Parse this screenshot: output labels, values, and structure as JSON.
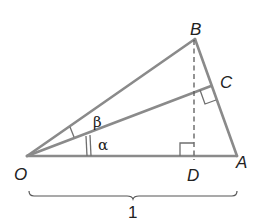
{
  "diagram": {
    "points": {
      "O": {
        "label": "O",
        "x": 27,
        "y": 156
      },
      "A": {
        "label": "A",
        "x": 237,
        "y": 156
      },
      "B": {
        "label": "B",
        "x": 195,
        "y": 39
      },
      "C": {
        "label": "C",
        "x": 211,
        "y": 86
      },
      "D": {
        "label": "D",
        "x": 194,
        "y": 156
      }
    },
    "angles": {
      "alpha": {
        "label": "α"
      },
      "beta": {
        "label": "β"
      }
    },
    "base_length": {
      "label": "1"
    },
    "colors": {
      "edge": "#8a8a8a",
      "text": "#222222",
      "background": "#ffffff"
    }
  }
}
